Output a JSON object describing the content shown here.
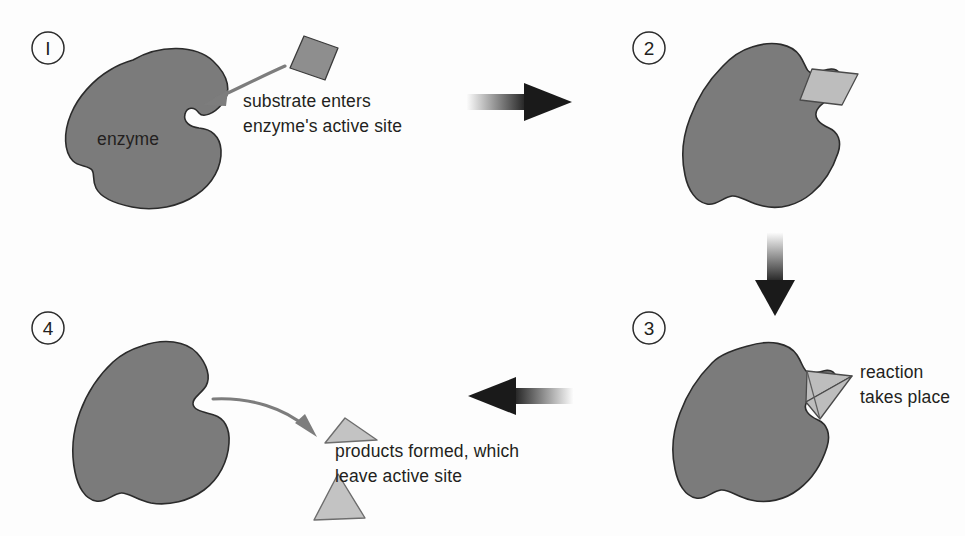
{
  "diagram": {
    "background_color": "#fdfdfd",
    "enzyme_color": "#7b7b7b",
    "enzyme_outline_color": "#2b2b2b",
    "substrate_color": "#8e8e8e",
    "product_color": "#c3c3c3",
    "text_color": "#231f20",
    "arrow_color": "#1a1a1a",
    "curved_arrow_color": "#7d7d7d"
  },
  "steps": [
    {
      "number": "1",
      "number_glyph": "I",
      "enzyme_label": "enzyme",
      "caption_lines": [
        "substrate enters",
        "enzyme's active site"
      ],
      "caption_full": "substrate enters enzyme's active site"
    },
    {
      "number": "2",
      "number_glyph": "2",
      "caption_lines": [],
      "caption_full": ""
    },
    {
      "number": "3",
      "number_glyph": "3",
      "caption_lines": [
        "reaction",
        "takes place"
      ],
      "caption_full": "reaction takes place"
    },
    {
      "number": "4",
      "number_glyph": "4",
      "caption_lines": [
        "products formed, which",
        "leave active site"
      ],
      "caption_full": "products formed, which leave active site"
    }
  ],
  "flow_arrows": [
    {
      "name": "arrow-step1-to-step2",
      "direction": "right"
    },
    {
      "name": "arrow-step2-to-step3",
      "direction": "down"
    },
    {
      "name": "arrow-step3-to-step4",
      "direction": "left"
    }
  ]
}
